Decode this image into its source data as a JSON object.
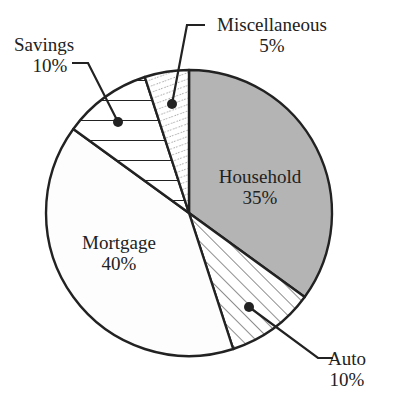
{
  "chart_data": {
    "type": "pie",
    "title": "",
    "start_angle_deg": 0,
    "direction": "clockwise",
    "slices": [
      {
        "label": "Household",
        "value": 35,
        "pct_label": "35%",
        "fill": "#b3b3b3",
        "pattern": "solid-gray",
        "label_position": "inside"
      },
      {
        "label": "Auto",
        "value": 10,
        "pct_label": "10%",
        "fill": "#ffffff",
        "pattern": "diagonal-hatch",
        "label_position": "callout"
      },
      {
        "label": "Mortgage",
        "value": 40,
        "pct_label": "40%",
        "fill": "#fdfdfd",
        "pattern": "none",
        "label_position": "inside"
      },
      {
        "label": "Savings",
        "value": 10,
        "pct_label": "10%",
        "fill": "#ffffff",
        "pattern": "horizontal-lines",
        "label_position": "callout"
      },
      {
        "label": "Miscellaneous",
        "value": 5,
        "pct_label": "5%",
        "fill": "#ffffff",
        "pattern": "dotted-diagonal",
        "label_position": "callout"
      }
    ],
    "legend": "none"
  },
  "labels": {
    "household": {
      "name": "Household",
      "pct": "35%"
    },
    "auto": {
      "name": "Auto",
      "pct": "10%"
    },
    "mortgage": {
      "name": "Mortgage",
      "pct": "40%"
    },
    "savings": {
      "name": "Savings",
      "pct": "10%"
    },
    "misc": {
      "name": "Miscellaneous",
      "pct": "5%"
    }
  }
}
